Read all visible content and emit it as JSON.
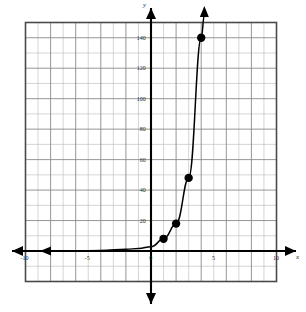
{
  "figure": {
    "kind": "cartesian-coordinate-plane",
    "background_color": "#ffffff",
    "frame_color": "#4a4a4a",
    "grid_minor_color": "#b9b9b9",
    "grid_major_color": "#8a8a8a",
    "axis_color": "#000000",
    "curve_color": "#000000",
    "point_color": "#000000"
  },
  "axis_labels": {
    "x_axis_name": "x",
    "y_axis_name": "y"
  },
  "x_ticks": [
    {
      "value": -10,
      "label": "-10"
    },
    {
      "value": -5,
      "label": "-5"
    },
    {
      "value": 0,
      "label": "0"
    },
    {
      "value": 5,
      "label": "5"
    },
    {
      "value": 10,
      "label": "10"
    }
  ],
  "y_ticks": [
    {
      "value": 20,
      "label": "20"
    },
    {
      "value": 40,
      "label": "40"
    },
    {
      "value": 60,
      "label": "60"
    },
    {
      "value": 80,
      "label": "80"
    },
    {
      "value": 100,
      "label": "100"
    },
    {
      "value": 120,
      "label": "120"
    },
    {
      "value": 140,
      "label": "140"
    }
  ],
  "chart_data": {
    "type": "line",
    "title": "",
    "xlabel": "x",
    "ylabel": "y",
    "xlim": [
      -10,
      10
    ],
    "ylim": [
      -20,
      150
    ],
    "grid": true,
    "legend": "none",
    "x_major_step": 5,
    "y_major_step": 20,
    "x_minor_step": 1,
    "y_minor_step": 10,
    "series": [
      {
        "name": "exponential curve",
        "style": "solid-curve-with-arrow-head-top",
        "x": [
          -10,
          -8,
          -6,
          -4,
          -2,
          -1,
          0,
          1,
          2,
          3,
          4,
          4.25
        ],
        "y": [
          0.0,
          0.01,
          0.05,
          0.4,
          1.1,
          1.7,
          2.8,
          8.0,
          18.0,
          48.0,
          140.0,
          155.0
        ]
      }
    ],
    "points": [
      {
        "x": 1,
        "y": 8,
        "label": ""
      },
      {
        "x": 2,
        "y": 18,
        "label": ""
      },
      {
        "x": 3,
        "y": 48,
        "label": ""
      },
      {
        "x": 4,
        "y": 140,
        "label": ""
      }
    ],
    "annotations": []
  }
}
